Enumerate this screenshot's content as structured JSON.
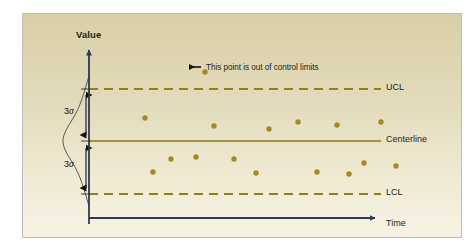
{
  "figure": {
    "title_text": "",
    "axes": {
      "y_label": "Value",
      "x_label": "Time"
    },
    "limit_labels": {
      "ucl": "UCL",
      "centerline": "Centerline",
      "lcl": "LCL"
    },
    "sigma_labels": {
      "upper": "3",
      "upper_symbol": "σ",
      "lower": "3",
      "lower_symbol": "σ"
    },
    "annotation": {
      "text": "This point is out of control limits"
    },
    "colors": {
      "marker": "#a8891f",
      "limit_line": "#94800f",
      "centerline": "#8c7a12",
      "axis": "#2b3a52",
      "curve": "#4a4a4a",
      "background_top": "#d9cfa6",
      "background_bottom": "#f7f3e4",
      "frame_border": "#b9bcc4",
      "text": "#1d1d1f"
    }
  },
  "chart_data": {
    "type": "scatter",
    "xlabel": "Time",
    "ylabel": "Value",
    "grid": false,
    "legend": null,
    "xlim": [
      0,
      440
    ],
    "ylim": [
      0,
      225
    ],
    "reference_lines": [
      {
        "name": "UCL",
        "label": "UCL",
        "y_px": 75,
        "style": "dashed",
        "color": "#94800f"
      },
      {
        "name": "Centerline",
        "label": "Centerline",
        "y_px": 127,
        "style": "solid",
        "color": "#8c7a12"
      },
      {
        "name": "LCL",
        "label": "LCL",
        "y_px": 180,
        "style": "dashed",
        "color": "#94800f"
      }
    ],
    "annotations": [
      {
        "text": "This point is out of control limits",
        "target_point_index": 0,
        "arrow": "left"
      }
    ],
    "points_px": [
      {
        "x": 182,
        "y": 58,
        "group": "out-of-control"
      },
      {
        "x": 122,
        "y": 104,
        "group": "in-control-upper"
      },
      {
        "x": 191,
        "y": 112,
        "group": "in-control-upper"
      },
      {
        "x": 246,
        "y": 115,
        "group": "in-control-upper"
      },
      {
        "x": 275,
        "y": 108,
        "group": "in-control-upper"
      },
      {
        "x": 314,
        "y": 111,
        "group": "in-control-upper"
      },
      {
        "x": 358,
        "y": 108,
        "group": "in-control-upper"
      },
      {
        "x": 130,
        "y": 158,
        "group": "in-control-lower"
      },
      {
        "x": 148,
        "y": 145,
        "group": "in-control-lower"
      },
      {
        "x": 173,
        "y": 143,
        "group": "in-control-lower"
      },
      {
        "x": 211,
        "y": 145,
        "group": "in-control-lower"
      },
      {
        "x": 233,
        "y": 159,
        "group": "in-control-lower"
      },
      {
        "x": 294,
        "y": 158,
        "group": "in-control-lower"
      },
      {
        "x": 326,
        "y": 160,
        "group": "in-control-lower"
      },
      {
        "x": 341,
        "y": 149,
        "group": "in-control-lower"
      },
      {
        "x": 373,
        "y": 152,
        "group": "in-control-lower"
      }
    ],
    "distribution_curve": {
      "description": "normal bell curve rotated 90 degrees on the y-axis",
      "mean_y_px": 127,
      "sigma_span_px": 52
    }
  }
}
